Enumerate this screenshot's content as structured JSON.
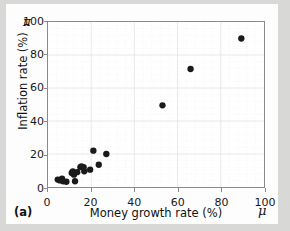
{
  "figure": {
    "panel_label": "(a)",
    "background_color": "#d8d8d6",
    "card_color": "#fdfdfd",
    "frame_color": "#8a8a8a",
    "marker_color": "#1a1a1a",
    "grid_color": "#e2e2e2"
  },
  "symbols": {
    "y_axis_symbol": "π",
    "x_axis_symbol": "μ"
  },
  "chart_data": {
    "type": "scatter",
    "title": "",
    "xlabel": "Money growth rate (%)",
    "ylabel": "Inflation rate (%)",
    "xlim": [
      0,
      100
    ],
    "ylim": [
      0,
      100
    ],
    "xticks": [
      0,
      20,
      40,
      60,
      80,
      100
    ],
    "yticks": [
      0,
      20,
      40,
      60,
      80,
      100
    ],
    "xticklabels": [
      "0",
      "20",
      "40",
      "60",
      "80",
      "100"
    ],
    "yticklabels": [
      "0",
      "20",
      "40",
      "60",
      "80",
      "100"
    ],
    "grid": true,
    "minor_ticks": true,
    "legend": false,
    "legend_position": "none",
    "marker": "circle",
    "marker_size": 4,
    "series": [
      {
        "name": "Countries",
        "points": [
          {
            "x": 4.5,
            "y": 4.5
          },
          {
            "x": 5.5,
            "y": 4.0
          },
          {
            "x": 6.5,
            "y": 5.0
          },
          {
            "x": 7.0,
            "y": 3.5
          },
          {
            "x": 8.5,
            "y": 3.2
          },
          {
            "x": 11.0,
            "y": 8.5
          },
          {
            "x": 11.5,
            "y": 9.5
          },
          {
            "x": 12.0,
            "y": 7.5
          },
          {
            "x": 12.5,
            "y": 3.5
          },
          {
            "x": 13.5,
            "y": 9.0
          },
          {
            "x": 15.0,
            "y": 12.0
          },
          {
            "x": 15.5,
            "y": 12.5
          },
          {
            "x": 16.5,
            "y": 12.0
          },
          {
            "x": 16.8,
            "y": 9.5
          },
          {
            "x": 19.5,
            "y": 10.5
          },
          {
            "x": 21.0,
            "y": 22.0
          },
          {
            "x": 23.5,
            "y": 13.5
          },
          {
            "x": 27.0,
            "y": 20.0
          },
          {
            "x": 53.0,
            "y": 49.5
          },
          {
            "x": 66.0,
            "y": 71.5
          },
          {
            "x": 89.5,
            "y": 90.0
          }
        ]
      }
    ]
  }
}
